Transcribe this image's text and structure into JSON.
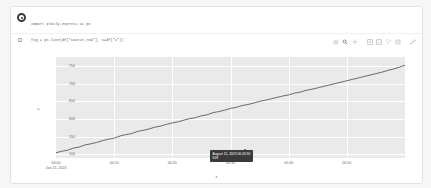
{
  "notebook": {
    "cell": {
      "run_icon": "run-cell-icon",
      "code": [
        "import plotly.express as px",
        "fig = px.line(df[\"source_row\"], x=df[\"x\"])",
        "fig.show()"
      ]
    },
    "output_marker": "D"
  },
  "modebar": {
    "buttons": [
      {
        "name": "camera-icon",
        "label": "Download plot as png"
      },
      {
        "name": "zoom-icon",
        "label": "Zoom",
        "active": true
      },
      {
        "name": "pan-icon",
        "label": "Pan"
      },
      {
        "name": "zoom-in-icon",
        "label": "Zoom in"
      },
      {
        "name": "zoom-out-icon",
        "label": "Zoom out"
      },
      {
        "name": "autoscale-icon",
        "label": "Autoscale"
      },
      {
        "name": "reset-axes-icon",
        "label": "Reset axes"
      },
      {
        "name": "plotly-logo-icon",
        "label": "Produced with Plotly"
      }
    ]
  },
  "tooltip": {
    "date": "August 15, 2023 00:24:30",
    "value": "618"
  },
  "chart_data": {
    "type": "line",
    "title": "",
    "xlabel": "x",
    "ylabel": "y",
    "grid": true,
    "legend": false,
    "xtick_labels": [
      {
        "line1": "00:00",
        "line2": "Jan 15, 2023"
      },
      {
        "line1": "00:10",
        "line2": ""
      },
      {
        "line1": "00:20",
        "line2": ""
      },
      {
        "line1": "00:30",
        "line2": ""
      },
      {
        "line1": "00:40",
        "line2": ""
      },
      {
        "line1": "00:50",
        "line2": ""
      }
    ],
    "ytick_labels": [
      "750",
      "700",
      "650",
      "600",
      "550",
      "500"
    ],
    "ylim": [
      490,
      775
    ],
    "xlim": [
      0,
      60
    ],
    "series": [
      {
        "name": "value",
        "color": "#5a5a5a",
        "x": [
          0,
          1,
          2,
          3,
          4,
          5,
          6,
          7,
          8,
          9,
          10,
          11,
          12,
          13,
          14,
          15,
          16,
          17,
          18,
          19,
          20,
          21,
          22,
          23,
          24,
          25,
          26,
          27,
          28,
          29,
          30,
          31,
          32,
          33,
          34,
          35,
          36,
          37,
          38,
          39,
          40,
          41,
          42,
          43,
          44,
          45,
          46,
          47,
          48,
          49,
          50,
          51,
          52,
          53,
          54,
          55,
          56,
          57,
          58,
          59,
          60
        ],
        "values": [
          505,
          509,
          512,
          518,
          521,
          527,
          530,
          534,
          539,
          543,
          546,
          552,
          556,
          559,
          565,
          568,
          572,
          577,
          580,
          585,
          589,
          592,
          597,
          601,
          604,
          609,
          612,
          618,
          621,
          625,
          630,
          633,
          638,
          641,
          645,
          650,
          653,
          657,
          661,
          665,
          668,
          673,
          676,
          681,
          684,
          688,
          692,
          696,
          700,
          704,
          708,
          712,
          716,
          720,
          724,
          728,
          732,
          737,
          741,
          746,
          752
        ]
      }
    ]
  }
}
